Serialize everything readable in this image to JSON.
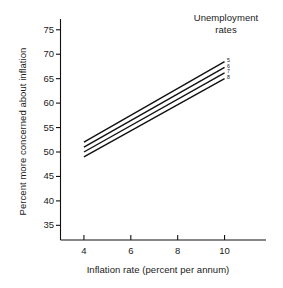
{
  "legend": {
    "title_line1": "Unemployment",
    "title_line2": "rates"
  },
  "axes": {
    "x_title": "Inflation rate (percent per annum)",
    "y_title": "Percent more concerned about inflation"
  },
  "chart_data": {
    "type": "line",
    "title": "",
    "subtitle": "",
    "xlabel": "Inflation rate (percent per annum)",
    "ylabel": "Percent more concerned about inflation",
    "xlim": [
      3,
      11
    ],
    "ylim": [
      32,
      77
    ],
    "xticks": [
      4,
      6,
      8,
      10
    ],
    "yticks": [
      35,
      40,
      45,
      50,
      55,
      60,
      65,
      70,
      75
    ],
    "xtick_labels": [
      "4",
      "6",
      "8",
      "10"
    ],
    "ytick_labels": [
      "35",
      "40",
      "45",
      "50",
      "55",
      "60",
      "65",
      "70",
      "75"
    ],
    "grid": false,
    "legend_position": "top-right",
    "legend_title": "Unemployment rates",
    "x": [
      4,
      10
    ],
    "series": [
      {
        "name": "5",
        "label": "5",
        "values": [
          52.0,
          68.5
        ],
        "color": "#111111"
      },
      {
        "name": "6",
        "label": "6",
        "values": [
          51.0,
          67.3
        ],
        "color": "#111111"
      },
      {
        "name": "7",
        "label": "7",
        "values": [
          50.0,
          66.2
        ],
        "color": "#111111"
      },
      {
        "name": "8",
        "label": "8",
        "values": [
          49.0,
          65.0
        ],
        "color": "#111111"
      }
    ]
  }
}
